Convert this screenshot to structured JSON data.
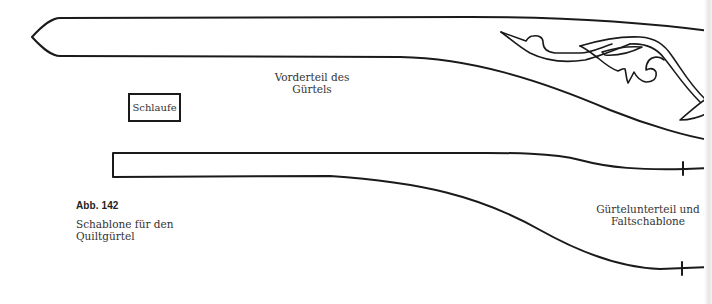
{
  "diagram": {
    "type": "sewing-pattern-template",
    "pieces": {
      "front_belt": {
        "label_line1": "Vorderteil des",
        "label_line2": "Gürtels"
      },
      "loop": {
        "label": "Schlaufe"
      },
      "lower_belt": {
        "label_line1": "Gürtelunterteil und",
        "label_line2": "Faltschablone"
      }
    },
    "ornament": "quilting-leaf-scroll-motif",
    "stroke_color": "#1a1a1a",
    "background_color": "#ffffff"
  },
  "caption": {
    "figure_number": "Abb. 142",
    "line1": "Schablone für den",
    "line2": "Quiltgürtel"
  }
}
